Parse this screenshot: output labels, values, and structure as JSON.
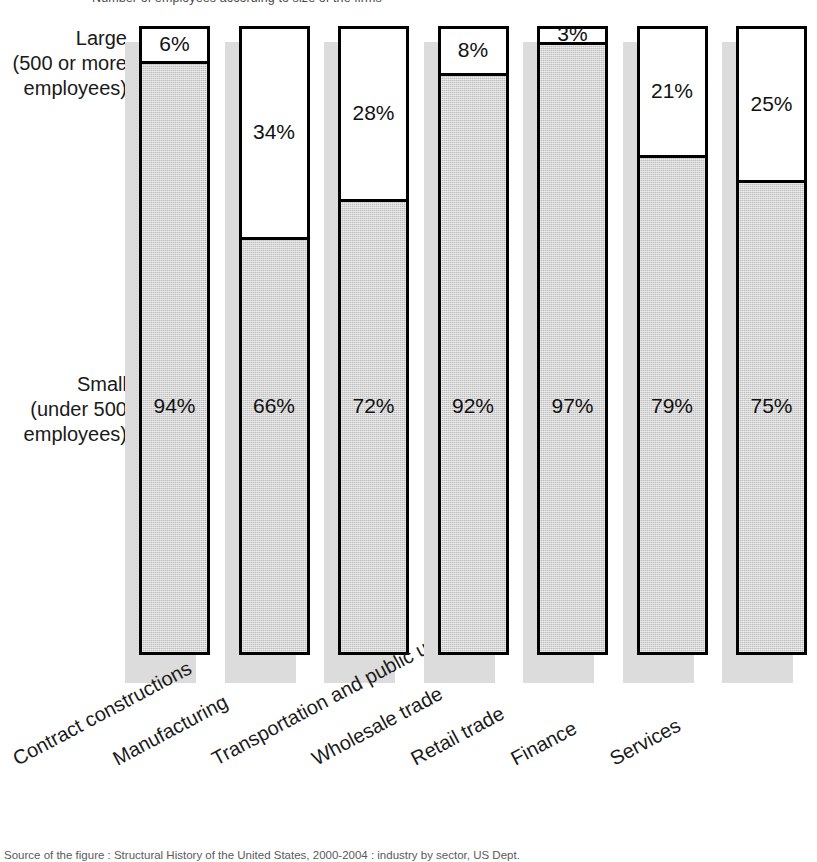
{
  "figure": {
    "top_partial_text": "Number of employees according to size of the firms",
    "bottom_partial_caption": "Source of the figure : Structural History of the United States, 2000-2004 : industry by sector, US Dept."
  },
  "axis": {
    "y_categories": [
      {
        "name": "large",
        "line1": "Large",
        "line2": "(500 or more",
        "line3": "employees)"
      },
      {
        "name": "small",
        "line1": "Small",
        "line2": "(under 500",
        "line3": "employees)"
      }
    ]
  },
  "chart_data": {
    "type": "bar",
    "subtype": "stacked-100-percent",
    "title": "",
    "subtitle": "",
    "xlabel": "",
    "ylabel": "",
    "ylim": [
      0,
      100
    ],
    "grid": false,
    "legend_position": "y-axis-left",
    "value_suffix": "%",
    "categories": [
      "Contract constructions",
      "Manufacturing",
      "Transportation and public utilities",
      "Wholesale trade",
      "Retail trade",
      "Finance",
      "Services"
    ],
    "series": [
      {
        "name": "Large (500 or more employees)",
        "color": "#ffffff",
        "values": [
          6,
          34,
          28,
          8,
          3,
          21,
          25
        ],
        "labels": [
          "6%",
          "34%",
          "28%",
          "8%",
          "3%",
          "21%",
          "25%"
        ]
      },
      {
        "name": "Small (under 500 employees)",
        "color": "#bdbdbd",
        "values": [
          94,
          66,
          72,
          92,
          97,
          79,
          75
        ],
        "labels": [
          "94%",
          "66%",
          "72%",
          "92%",
          "97%",
          "79%",
          "75%"
        ]
      }
    ]
  },
  "colors": {
    "large_fill": "#ffffff",
    "small_fill": "#bdbdbd",
    "bar_outline": "#000000",
    "shadow": "#dcdcdc",
    "text": "#1a1a1a",
    "background": "#ffffff"
  }
}
